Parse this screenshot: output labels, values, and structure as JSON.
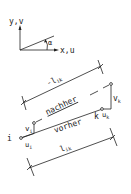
{
  "diagram": {
    "axes": {
      "y_label": "y,v",
      "x_label": "x,u",
      "angle_label": "α"
    },
    "dimension_top": {
      "label_prefix": "-",
      "label_main": "l",
      "label_sub": "ik"
    },
    "dimension_bottom": {
      "label_main": "l",
      "label_sub": "ik"
    },
    "states": {
      "after": "nachher",
      "before": "vorher"
    },
    "nodes": {
      "i": {
        "name": "i",
        "u": "u",
        "u_sub": "i",
        "v": "v",
        "v_sub": "i"
      },
      "k": {
        "name": "k",
        "u": "u",
        "u_sub": "k",
        "v": "v",
        "v_sub": "k"
      }
    },
    "colors": {
      "line": "#222222",
      "background": "#ffffff"
    }
  }
}
